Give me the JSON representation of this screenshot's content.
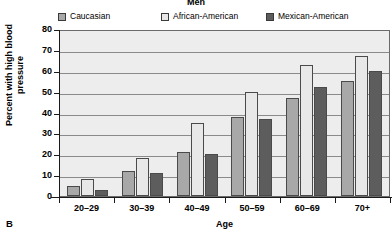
{
  "panel": {
    "label": "B"
  },
  "chart_data": {
    "type": "bar",
    "title": "Men",
    "xlabel": "Age",
    "ylabel": "Percent with high blood pressure",
    "categories": [
      "20–29",
      "30–39",
      "40–49",
      "50–59",
      "60–69",
      "70+"
    ],
    "series": [
      {
        "name": "Caucasian",
        "color": "#a8a8a8",
        "values": [
          5,
          12,
          21,
          38,
          47,
          55
        ]
      },
      {
        "name": "African-American",
        "color": "#e8e8e8",
        "values": [
          8,
          18,
          35,
          50,
          63,
          67
        ]
      },
      {
        "name": "Mexican-American",
        "color": "#5d5d5d",
        "values": [
          3,
          11,
          20,
          37,
          52,
          60
        ]
      }
    ],
    "ylim": [
      0,
      80
    ],
    "yticks": [
      0,
      10,
      20,
      30,
      40,
      50,
      60,
      70,
      80
    ],
    "ytick_labels": [
      "0",
      "10",
      "20",
      "30",
      "40",
      "50",
      "60",
      "70",
      "80"
    ],
    "grid": true,
    "legend_position": "top"
  }
}
